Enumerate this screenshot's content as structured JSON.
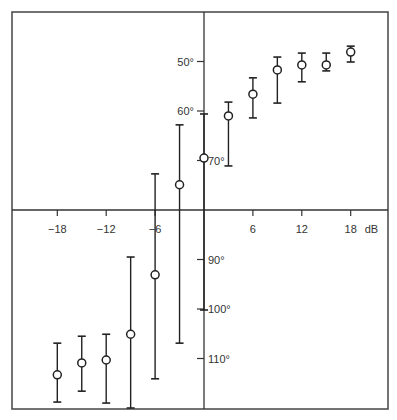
{
  "chart_data": {
    "type": "scatter",
    "subtype": "errorbar",
    "title": "",
    "xlabel": "dB",
    "ylabel": "",
    "x_unit": "dB",
    "y_unit": "°",
    "y_inverted": true,
    "xlim": [
      -24,
      24
    ],
    "ylim": [
      40,
      120
    ],
    "x_ticks": [
      -18,
      -12,
      -6,
      6,
      12,
      18
    ],
    "x_tick_labels": [
      "−18",
      "−12",
      "−6",
      "6",
      "12",
      "18"
    ],
    "y_ticks": [
      50,
      60,
      70,
      90,
      100,
      110
    ],
    "y_tick_labels": [
      "50°",
      "60°",
      "70°",
      "90°",
      "100°",
      "110°"
    ],
    "axis_cross": {
      "x": 0,
      "y": 80
    },
    "grid": false,
    "legend": null,
    "series": [
      {
        "name": "mean ± range",
        "x": [
          -18,
          -15,
          -12,
          -9,
          -6,
          -3,
          0,
          3,
          6,
          9,
          12,
          15,
          18
        ],
        "y": [
          113.3,
          110.9,
          110.3,
          105.1,
          93.1,
          74.9,
          69.5,
          61.0,
          56.6,
          51.7,
          50.7,
          50.7,
          48.1
        ],
        "y_upper": [
          106.9,
          105.5,
          105.1,
          89.5,
          72.7,
          62.8,
          60.6,
          58.2,
          53.3,
          49.1,
          48.3,
          48.3,
          46.9
        ],
        "y_lower": [
          118.8,
          116.6,
          119.0,
          120.0,
          114.1,
          106.9,
          100.2,
          71.1,
          61.4,
          58.4,
          54.1,
          51.9,
          50.1
        ],
        "marker": "open-circle"
      }
    ]
  },
  "colors": {
    "background": "#ffffff",
    "frame": "#444444",
    "axis": "#333333",
    "data": "#222222",
    "text": "#333333"
  },
  "layout": {
    "frame": {
      "left": 12,
      "top": 12,
      "right": 388,
      "bottom": 409
    },
    "origin_px": {
      "x": 204,
      "y": 210
    },
    "px_per_x_unit": 8.15,
    "px_per_y_unit": 4.95
  }
}
